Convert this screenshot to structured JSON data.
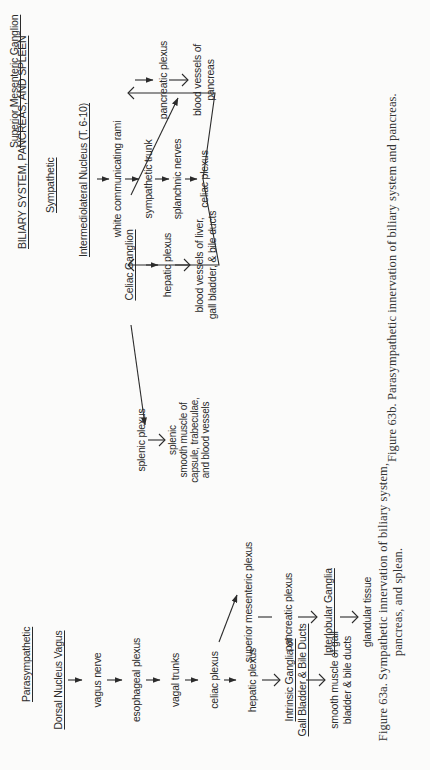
{
  "page": {
    "orientation": "rotated 90 degrees counter-clockwise",
    "background": "#fbfbfa",
    "ink": "#2b2b2b"
  },
  "figure_a": {
    "heading": "Parasympathetic",
    "nodes": {
      "origin": "Dorsal Nucleus Vagus",
      "vagus_nerve": "vagus nerve",
      "esophageal_plexus": "esophageal plexus",
      "vagal_trunks": "vagal trunks",
      "celiac_plexus": "celiac plexus",
      "hepatic_plexus": "hepatic plexus",
      "intrinsic_ganglia_1": "Intrinsic Ganglia of",
      "intrinsic_ganglia_2": "Gall Bladder & Bile Ducts",
      "smooth_muscle_1": "smooth muscle of gall",
      "smooth_muscle_2": "bladder & bile ducts",
      "superior_mesenteric_plexus": "superior mesenteric plexus",
      "pancreatic_plexus": "pancreatic plexus",
      "interlobular_ganglia": "Interlobular Ganglia",
      "glandular_tissue": "glandular tissue"
    },
    "caption_line1": "Figure 63a. Sympathetic innervation of biliary system,",
    "caption_line2": "pancreas, and splean."
  },
  "figure_b": {
    "title": "BILIARY SYSTEM, PANCREAS, AND SPLEEN",
    "heading": "Sympathetic",
    "nodes": {
      "origin": "Intermediolateral Nucleus (T. 6-10)",
      "white_rami": "white communicating rami",
      "sympathetic_trunk": "sympathetic trunk",
      "splanchnic_nerves": "splanchnic nerves",
      "celiac_plexus": "celiac plexus",
      "celiac_ganglion": "Celiac Ganglion",
      "superior_mesenteric_ganglion": "Superior Mesenteric Ganglion",
      "pancreatic_plexus": "pancreatic plexus",
      "pancreas_vessels_1": "blood vessels of",
      "pancreas_vessels_2": "pancreas",
      "hepatic_plexus": "hepatic plexus",
      "liver_vessels_1": "blood vessels of liver,",
      "liver_vessels_2": "gall bladder,  & bile ducts",
      "splenic_plexus": "splenic plexus",
      "splenic_target_1": "splenic",
      "splenic_target_2": "smooth muscle of",
      "splenic_target_3": "capsule,  trabeculae,",
      "splenic_target_4": "and blood vessels"
    },
    "caption": "Figure 63b. Parasympathetic innervation of biliary system and pancreas."
  }
}
